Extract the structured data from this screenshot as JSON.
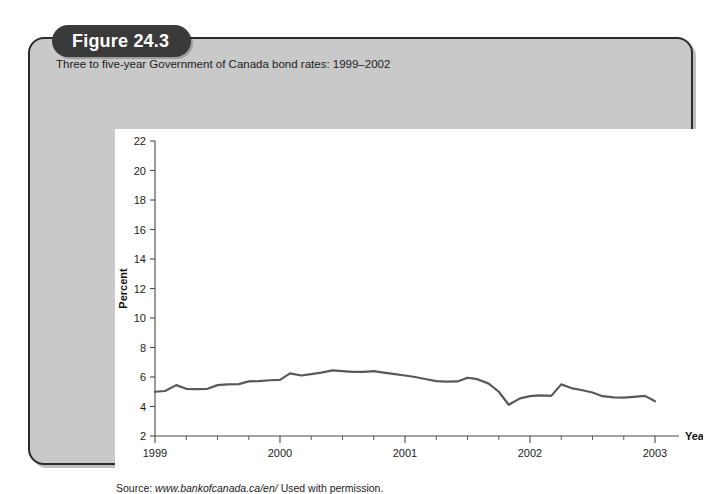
{
  "figure": {
    "badge_label": "Figure 24.3",
    "subtitle": "Three to five-year Government of Canada bond rates: 1999–2002",
    "source_prefix": "Source:",
    "source_url": "www.bankofcanada.ca/en/",
    "source_suffix": "Used with permission."
  },
  "colors": {
    "card_background": "#c9c9c9",
    "card_border": "#2b2b2b",
    "badge_background": "#3a3a3a",
    "badge_text": "#ffffff",
    "panel_background": "#ffffff",
    "line": "#595959",
    "axis": "#4a4a4a",
    "text": "#1b1b1b"
  },
  "chart_data": {
    "type": "line",
    "title": "Three to five-year Government of Canada bond rates: 1999–2002",
    "xlabel": "Year",
    "ylabel": "Percent",
    "xlim": [
      1999.0,
      2003.0
    ],
    "ylim": [
      2,
      22
    ],
    "yticks": [
      2,
      4,
      6,
      8,
      10,
      12,
      14,
      16,
      18,
      20,
      22
    ],
    "xticks": [
      1999,
      2000,
      2001,
      2002,
      2003
    ],
    "x_minor_ticks_per_year": 4,
    "grid": false,
    "legend": false,
    "series": [
      {
        "name": "Three to five-year Government of Canada bond rate",
        "x": [
          1999.0,
          1999.08,
          1999.17,
          1999.25,
          1999.33,
          1999.42,
          1999.5,
          1999.58,
          1999.67,
          1999.75,
          1999.83,
          1999.92,
          2000.0,
          2000.08,
          2000.17,
          2000.25,
          2000.33,
          2000.42,
          2000.5,
          2000.58,
          2000.67,
          2000.75,
          2000.83,
          2000.92,
          2001.0,
          2001.08,
          2001.17,
          2001.25,
          2001.33,
          2001.42,
          2001.5,
          2001.58,
          2001.67,
          2001.75,
          2001.83,
          2001.92,
          2002.0,
          2002.08,
          2002.17,
          2002.25,
          2002.33,
          2002.42,
          2002.5,
          2002.58,
          2002.67,
          2002.75,
          2002.83,
          2002.92,
          2003.0
        ],
        "values": [
          5.0,
          5.05,
          5.45,
          5.2,
          5.18,
          5.2,
          5.45,
          5.5,
          5.52,
          5.7,
          5.72,
          5.78,
          5.8,
          6.25,
          6.1,
          6.2,
          6.3,
          6.45,
          6.4,
          6.35,
          6.35,
          6.4,
          6.3,
          6.2,
          6.1,
          6.0,
          5.85,
          5.72,
          5.68,
          5.7,
          5.95,
          5.85,
          5.55,
          5.0,
          4.12,
          4.55,
          4.7,
          4.75,
          4.72,
          5.5,
          5.25,
          5.1,
          4.95,
          4.7,
          4.62,
          4.6,
          4.65,
          4.72,
          4.35
        ]
      }
    ]
  }
}
